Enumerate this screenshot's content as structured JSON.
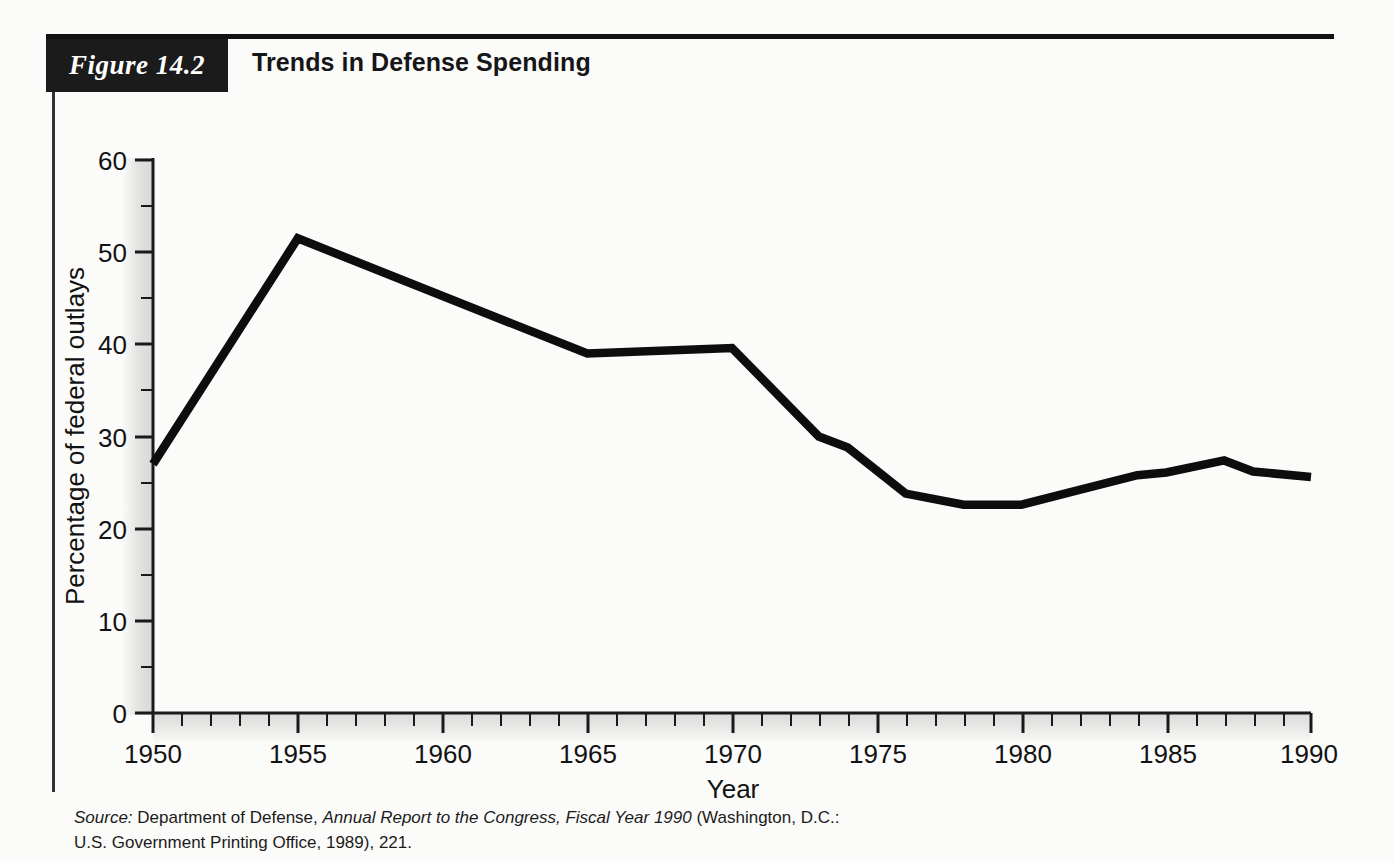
{
  "figure": {
    "badge": "Figure 14.2",
    "title": "Trends in Defense Spending"
  },
  "source": {
    "label": "Source:",
    "pre_title": " Department of Defense, ",
    "title": "Annual Report to the Congress, Fiscal Year 1990",
    "post_title": " (Washington, D.C.:",
    "line2": "U.S. Government Printing Office, 1989), 221."
  },
  "chart_data": {
    "type": "line",
    "title": "Trends in Defense Spending",
    "xlabel": "Year",
    "ylabel": "Percentage of federal outlays",
    "xlim": [
      1950,
      1990
    ],
    "ylim": [
      0,
      60
    ],
    "grid": false,
    "legend": null,
    "x_major_ticks": [
      1950,
      1955,
      1960,
      1965,
      1970,
      1975,
      1980,
      1985,
      1990
    ],
    "x_tick_labels": [
      "1950",
      "1955",
      "1960",
      "1965",
      "1970",
      "1975",
      "1980",
      "1985",
      "1990"
    ],
    "x_minor_tick_step": 1,
    "y_major_ticks": [
      0,
      10,
      20,
      30,
      40,
      50,
      60
    ],
    "y_tick_labels": [
      "0",
      "10",
      "20",
      "30",
      "40",
      "50",
      "60"
    ],
    "y_minor_tick_step": 5,
    "series": [
      {
        "name": "Defense spending as percentage of federal outlays",
        "color": "#0d0d0d",
        "x": [
          1950,
          1955,
          1965,
          1970,
          1973,
          1974,
          1976,
          1978,
          1980,
          1982,
          1984,
          1985,
          1987,
          1988,
          1990
        ],
        "values": [
          27.0,
          51.5,
          39.0,
          39.6,
          30.0,
          28.8,
          23.8,
          22.6,
          22.6,
          24.2,
          25.8,
          26.1,
          27.4,
          26.2,
          25.6
        ]
      }
    ]
  }
}
